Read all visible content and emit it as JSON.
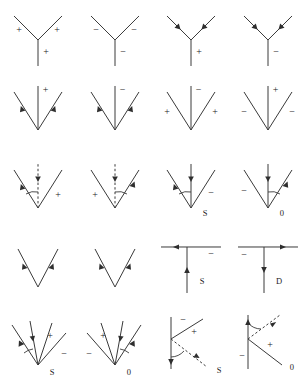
{
  "figure": {
    "title": "",
    "background_color": "#ffffff",
    "line_color": "#3a3a3a",
    "text_color": "#222222",
    "rows": 5,
    "columns": 4,
    "total_panels": 20
  },
  "panels": [
    {
      "id": "r1c1",
      "shape": "y-vertex-up",
      "labels": {
        "left": "+",
        "right": "+",
        "stem": "+"
      },
      "arrows": [],
      "corner_label": "",
      "dashed": false,
      "angle_arc": false
    },
    {
      "id": "r1c2",
      "shape": "y-vertex-up",
      "labels": {
        "left": "−",
        "right": "−",
        "stem": "−"
      },
      "arrows": [],
      "corner_label": "",
      "dashed": false,
      "angle_arc": false
    },
    {
      "id": "r1c3",
      "shape": "y-vertex-up",
      "labels": {
        "left": "",
        "right": "",
        "stem": "+"
      },
      "arrows": [
        "left-branch-inward",
        "right-branch-inward"
      ],
      "corner_label": "",
      "dashed": false,
      "angle_arc": false
    },
    {
      "id": "r1c4",
      "shape": "y-vertex-up",
      "labels": {
        "left": "",
        "right": "",
        "stem": "−"
      },
      "arrows": [
        "left-branch-inward",
        "right-branch-inward"
      ],
      "corner_label": "",
      "dashed": false,
      "angle_arc": false
    },
    {
      "id": "r2c1",
      "shape": "v-vertex-down-with-stem",
      "labels": {
        "left": "",
        "right": "",
        "stem": "+"
      },
      "arrows": [
        "left-branch-inward",
        "right-branch-inward"
      ],
      "corner_label": "",
      "dashed": false,
      "angle_arc": false
    },
    {
      "id": "r2c2",
      "shape": "v-vertex-down-with-stem",
      "labels": {
        "left": "",
        "right": "",
        "stem": "−"
      },
      "arrows": [
        "left-branch-inward",
        "right-branch-inward"
      ],
      "corner_label": "",
      "dashed": false,
      "angle_arc": false
    },
    {
      "id": "r2c3",
      "shape": "v-vertex-down-with-stem",
      "labels": {
        "left": "+",
        "right": "+",
        "stem": "−"
      },
      "arrows": [],
      "corner_label": "",
      "dashed": false,
      "angle_arc": false
    },
    {
      "id": "r2c4",
      "shape": "v-vertex-down-with-stem",
      "labels": {
        "left": "−",
        "right": "−",
        "stem": "+"
      },
      "arrows": [],
      "corner_label": "",
      "dashed": false,
      "angle_arc": false
    },
    {
      "id": "r3c1",
      "shape": "v-vertex-down-with-stem",
      "labels": {
        "left": "",
        "right": "+",
        "stem": ""
      },
      "arrows": [
        "left-branch-inward",
        "stem-down"
      ],
      "corner_label": "",
      "dashed": true,
      "angle_arc": "left"
    },
    {
      "id": "r3c2",
      "shape": "v-vertex-down-with-stem",
      "labels": {
        "left": "+",
        "right": "",
        "stem": ""
      },
      "arrows": [
        "right-branch-outward",
        "stem-down"
      ],
      "corner_label": "",
      "dashed": true,
      "angle_arc": "right"
    },
    {
      "id": "r3c3",
      "shape": "v-vertex-down-with-stem",
      "labels": {
        "left": "",
        "right": "−",
        "stem": ""
      },
      "arrows": [
        "left-branch-inward",
        "stem-down"
      ],
      "corner_label": "S",
      "dashed": false,
      "angle_arc": "left"
    },
    {
      "id": "r3c4",
      "shape": "v-vertex-down-with-stem",
      "labels": {
        "left": "−",
        "right": "",
        "stem": ""
      },
      "arrows": [
        "right-branch-outward",
        "stem-down"
      ],
      "corner_label": "0",
      "dashed": false,
      "angle_arc": "right"
    },
    {
      "id": "r4c1",
      "shape": "v-plain",
      "labels": {
        "left": "",
        "right": "",
        "stem": ""
      },
      "arrows": [
        "left-branch-inward",
        "right-branch-inward"
      ],
      "corner_label": "",
      "dashed": false,
      "angle_arc": false
    },
    {
      "id": "r4c2",
      "shape": "v-plain",
      "labels": {
        "left": "",
        "right": "",
        "stem": ""
      },
      "arrows": [
        "left-branch-inward",
        "right-branch-inward"
      ],
      "corner_label": "",
      "dashed": false,
      "angle_arc": false
    },
    {
      "id": "r4c3",
      "shape": "t-junction",
      "labels": {
        "left": "",
        "right": "−",
        "stem": ""
      },
      "arrows": [
        "horizontal-left",
        "stem-up"
      ],
      "corner_label": "S",
      "dashed": false,
      "angle_arc": false
    },
    {
      "id": "r4c4",
      "shape": "t-junction",
      "labels": {
        "left": "−",
        "right": "",
        "stem": ""
      },
      "arrows": [
        "horizontal-right",
        "stem-down"
      ],
      "corner_label": "D",
      "dashed": false,
      "angle_arc": false
    },
    {
      "id": "r5c1",
      "shape": "four-ray-fan",
      "labels": {
        "ray3": "+",
        "ray4": "−"
      },
      "arrows": [
        "ray1-inward",
        "ray2-inward"
      ],
      "corner_label": "S",
      "dashed": false,
      "angle_arc": "left"
    },
    {
      "id": "r5c2",
      "shape": "four-ray-fan",
      "labels": {
        "ray1": "−",
        "ray2": "+"
      },
      "arrows": [
        "ray3-outward",
        "ray4-inward"
      ],
      "corner_label": "0",
      "dashed": false,
      "angle_arc": "right"
    },
    {
      "id": "r5c3",
      "shape": "vertical-with-branch-and-dashed",
      "labels": {
        "top": "−",
        "branch": "+"
      },
      "arrows": [
        "stem-down",
        "dashed-inward"
      ],
      "corner_label": "S",
      "dashed": true,
      "angle_arc": "right"
    },
    {
      "id": "r5c4",
      "shape": "vertical-with-branch-and-dashed",
      "labels": {
        "bottom": "−",
        "branch": "+"
      },
      "arrows": [
        "stem-up",
        "dashed-inward"
      ],
      "corner_label": "0",
      "dashed": true,
      "angle_arc": "right"
    }
  ]
}
